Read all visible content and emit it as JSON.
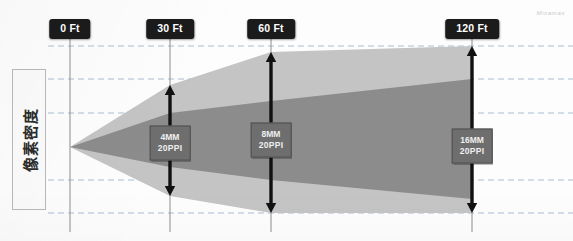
{
  "diagram": {
    "title_watermark": "Minamax",
    "y_axis_label": "像素密度",
    "canvas": {
      "width": 573,
      "height": 241
    }
  },
  "chart_data": {
    "type": "area",
    "title": "像素密度",
    "xlabel": "",
    "ylabel": "像素密度",
    "x_unit": "Ft",
    "categories": [
      "0 Ft",
      "30 Ft",
      "60 Ft",
      "120 Ft"
    ],
    "x_values": [
      0,
      30,
      60,
      120
    ],
    "x_pixels": [
      70,
      170,
      271,
      472
    ],
    "grid": true,
    "gridlines_y": [
      46,
      79,
      113,
      180,
      213
    ],
    "apex": {
      "x": 70,
      "y": 147
    },
    "series": [
      {
        "name": "outer-beam",
        "color": "#c4c4c4",
        "top_y": [
          147,
          85,
          52,
          46
        ],
        "bottom_y": [
          147,
          196,
          213,
          213
        ]
      },
      {
        "name": "inner-beam",
        "color": "#8c8c8c",
        "top_y": [
          147,
          113,
          101,
          79
        ],
        "bottom_y": [
          147,
          167,
          180,
          199
        ]
      }
    ],
    "annotations": [
      {
        "at": "30 Ft",
        "size": "4MM",
        "density": "20PPI",
        "x": 170,
        "y": 143
      },
      {
        "at": "60 Ft",
        "size": "8MM",
        "density": "20PPI",
        "x": 271,
        "y": 140
      },
      {
        "at": "120 Ft",
        "size": "16MM",
        "density": "20PPI",
        "x": 472,
        "y": 146
      }
    ],
    "measure_arrows": [
      {
        "label": "30 Ft",
        "x": 170,
        "top": 85,
        "bottom": 196
      },
      {
        "label": "60 Ft",
        "x": 271,
        "top": 52,
        "bottom": 213
      },
      {
        "label": "120 Ft",
        "x": 472,
        "top": 46,
        "bottom": 213
      }
    ]
  },
  "pills": [
    {
      "id": "pill-0ft",
      "label": "0 Ft",
      "x": 70,
      "y": 19
    },
    {
      "id": "pill-30ft",
      "label": "30 Ft",
      "x": 170,
      "y": 19
    },
    {
      "id": "pill-60ft",
      "label": "60 Ft",
      "x": 271,
      "y": 19
    },
    {
      "id": "pill-120ft",
      "label": "120 Ft",
      "x": 472,
      "y": 19
    }
  ],
  "chips": [
    {
      "id": "chip-30ft",
      "line1": "4MM",
      "line2": "20PPI",
      "x": 170,
      "y": 143
    },
    {
      "id": "chip-60ft",
      "line1": "8MM",
      "line2": "20PPI",
      "x": 271,
      "y": 140
    },
    {
      "id": "chip-120ft",
      "line1": "16MM",
      "line2": "20PPI",
      "x": 472,
      "y": 146
    }
  ],
  "colors": {
    "outer_beam": "#c4c4c4",
    "inner_beam": "#8c8c8c",
    "pill_bg": "#1b1b1b",
    "pill_text": "#ffffff",
    "chip_bg": "#6e6e6e",
    "chip_text": "#efefef",
    "gridline": "#9fb4cc",
    "stem": "#8d8d8d",
    "arrow": "#111111",
    "background": "#fdfdfd"
  }
}
